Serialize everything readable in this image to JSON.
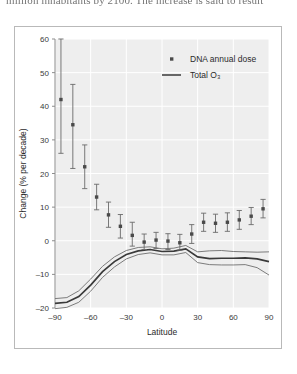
{
  "page": {
    "body_text_fragment": "million inhabitants by 2100. The increase is said to result"
  },
  "chart_data": {
    "type": "scatter",
    "title": "",
    "xlabel": "Latitude",
    "ylabel": "Change (% per decade)",
    "xlim": [
      -90,
      90
    ],
    "ylim": [
      -20,
      60
    ],
    "xticks": [
      -90,
      -60,
      -30,
      0,
      30,
      60,
      90
    ],
    "xtick_labels": [
      "–90",
      "–60",
      "–30",
      "0",
      "30",
      "60",
      "90"
    ],
    "yticks": [
      -20,
      -10,
      0,
      10,
      20,
      30,
      40,
      50,
      60
    ],
    "ytick_labels": [
      "–20",
      "–10",
      "0",
      "10",
      "20",
      "30",
      "40",
      "50",
      "60"
    ],
    "grid": true,
    "grid_color": "#ffffff",
    "plot_bg": "#eeeeee",
    "legend_position": "top-right",
    "legend": [
      {
        "label": "DNA annual dose",
        "marker": "dot",
        "color": "#4a4a4a"
      },
      {
        "label": "Total O₃",
        "marker": "line",
        "color": "#3a3a3a"
      }
    ],
    "series": [
      {
        "name": "DNA annual dose",
        "type": "scatter-errorbar",
        "marker": "dot",
        "color": "#4a4a4a",
        "x": [
          -85,
          -75,
          -65,
          -55,
          -45,
          -35,
          -25,
          -15,
          -5,
          5,
          15,
          25,
          35,
          45,
          55,
          65,
          75,
          85
        ],
        "values": [
          42.0,
          34.5,
          22.0,
          13.0,
          7.7,
          4.3,
          1.6,
          -0.4,
          0.2,
          -0.1,
          -0.6,
          2.0,
          5.5,
          5.2,
          5.5,
          6.2,
          7.3,
          9.5
        ],
        "err_low": [
          26.0,
          21.5,
          15.5,
          9.2,
          4.0,
          0.8,
          -1.6,
          -2.6,
          -2.3,
          -2.6,
          -2.8,
          -0.8,
          2.8,
          2.5,
          2.8,
          3.4,
          4.8,
          6.8
        ],
        "err_high": [
          60.0,
          46.5,
          28.5,
          16.8,
          11.5,
          7.8,
          5.5,
          2.0,
          2.5,
          2.1,
          1.9,
          4.8,
          8.2,
          7.9,
          8.3,
          9.0,
          9.9,
          12.3
        ]
      },
      {
        "name": "Total O₃",
        "type": "line-band",
        "color": "#3a3a3a",
        "x": [
          -90,
          -80,
          -70,
          -60,
          -50,
          -40,
          -30,
          -20,
          -10,
          0,
          10,
          20,
          30,
          40,
          50,
          60,
          70,
          80,
          90
        ],
        "center": [
          -18.6,
          -18.3,
          -16.6,
          -13.2,
          -9.2,
          -6.2,
          -4.1,
          -3.0,
          -2.6,
          -3.2,
          -3.1,
          -2.4,
          -4.8,
          -5.3,
          -5.2,
          -5.2,
          -5.1,
          -5.4,
          -6.2
        ],
        "upper": [
          -17.2,
          -16.9,
          -14.9,
          -11.4,
          -7.6,
          -4.8,
          -2.9,
          -2.0,
          -1.8,
          -2.4,
          -2.2,
          -1.4,
          -3.3,
          -3.0,
          -2.9,
          -3.2,
          -3.3,
          -3.4,
          -3.3
        ],
        "lower": [
          -20.2,
          -19.8,
          -18.3,
          -15.0,
          -10.9,
          -7.8,
          -5.4,
          -4.1,
          -3.6,
          -4.2,
          -4.2,
          -3.5,
          -6.5,
          -7.1,
          -7.2,
          -7.2,
          -7.1,
          -8.0,
          -10.2
        ]
      }
    ]
  }
}
